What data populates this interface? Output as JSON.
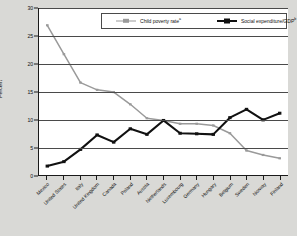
{
  "chart_data": {
    "type": "line",
    "title": "",
    "xlabel": "",
    "ylabel": "Percent",
    "ylim": [
      0,
      30
    ],
    "yticks": [
      0,
      5,
      10,
      15,
      20,
      25,
      30
    ],
    "grid": true,
    "legend_position": "top-center",
    "categories": [
      "Mexico",
      "United States",
      "Italy",
      "United Kingdom",
      "Canada",
      "Poland",
      "Austria",
      "Netherlands",
      "Luxembourg",
      "Germany",
      "Hungary",
      "Belgium",
      "Sweden",
      "Norway",
      "Finland"
    ],
    "series": [
      {
        "name": "Child poverty rate",
        "name_superscript": "a",
        "color": "#9a9a9a",
        "values": [
          26.9,
          21.7,
          16.6,
          15.3,
          14.9,
          12.7,
          10.2,
          9.8,
          9.2,
          9.2,
          8.9,
          7.5,
          4.4,
          3.6,
          3.0
        ]
      },
      {
        "name": "Social expenditure/GDP",
        "name_superscript": "b",
        "color": "#111111",
        "values": [
          1.6,
          2.4,
          4.6,
          7.2,
          5.9,
          8.3,
          7.3,
          9.8,
          7.5,
          7.4,
          7.3,
          10.3,
          11.8,
          9.9,
          11.1
        ]
      }
    ]
  },
  "legend": {
    "entries": [
      {
        "label": "Child poverty rate",
        "superscript": "a"
      },
      {
        "label": "Social expenditure/GDP",
        "superscript": "b"
      }
    ]
  },
  "axes": {
    "y_title": "Percent"
  }
}
